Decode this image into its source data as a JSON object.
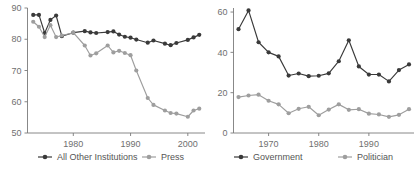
{
  "figure": {
    "background": "#ffffff",
    "panel_count": 2
  },
  "colors": {
    "dark_series": "#3a3a3a",
    "light_series": "#9e9e9e",
    "axis": "#7a7a7a",
    "tick_label": "#6f6f6f",
    "legend_label": "#555555"
  },
  "chart_data": [
    {
      "type": "line",
      "title": "",
      "xlabel": "",
      "ylabel": "",
      "xlim": [
        1972,
        2003
      ],
      "ylim": [
        50,
        90
      ],
      "ytick_values": [
        50,
        60,
        70,
        80,
        90
      ],
      "ytick_labels": [
        "50",
        "60",
        "70",
        "80",
        "90"
      ],
      "xtick_values": [
        1980,
        1990,
        2000
      ],
      "xtick_labels": [
        "1980",
        "1990",
        "2000"
      ],
      "grid": false,
      "legend_position": "below",
      "markers": "circle",
      "series": [
        {
          "name": "All Other Institutions",
          "color": "#3a3a3a",
          "x": [
            1973,
            1974,
            1975,
            1976,
            1977,
            1978,
            1980,
            1982,
            1983,
            1984,
            1986,
            1987,
            1988,
            1989,
            1990,
            1991,
            1993,
            1994,
            1996,
            1997,
            1998,
            2000,
            2001,
            2002
          ],
          "values": [
            87.8,
            87.8,
            82.0,
            86.2,
            87.6,
            81.0,
            82.1,
            82.6,
            82.2,
            82.0,
            82.3,
            82.5,
            81.5,
            80.8,
            80.5,
            79.9,
            78.9,
            79.6,
            78.6,
            78.1,
            78.8,
            79.8,
            80.6,
            81.4
          ]
        },
        {
          "name": "Press",
          "color": "#9e9e9e",
          "x": [
            1973,
            1974,
            1975,
            1976,
            1977,
            1978,
            1980,
            1982,
            1983,
            1984,
            1986,
            1987,
            1988,
            1989,
            1990,
            1991,
            1993,
            1994,
            1996,
            1997,
            1998,
            2000,
            2001,
            2002
          ],
          "values": [
            85.6,
            84.0,
            80.7,
            84.5,
            80.7,
            81.2,
            82.1,
            78.0,
            74.8,
            75.5,
            78.0,
            75.8,
            76.3,
            75.6,
            74.9,
            70.0,
            61.2,
            59.0,
            57.2,
            56.4,
            56.2,
            55.2,
            57.2,
            57.8
          ]
        }
      ]
    },
    {
      "type": "line",
      "title": "",
      "xlabel": "",
      "ylabel": "",
      "xlim": [
        1963,
        1999
      ],
      "ylim": [
        0,
        62
      ],
      "ytick_values": [
        0,
        20,
        40,
        60
      ],
      "ytick_labels": [
        "0",
        "20",
        "40",
        "60"
      ],
      "xtick_values": [
        1970,
        1980,
        1990
      ],
      "xtick_labels": [
        "1970",
        "1980",
        "1990"
      ],
      "grid": false,
      "legend_position": "below",
      "markers": "circle",
      "series": [
        {
          "name": "Government",
          "color": "#3a3a3a",
          "x": [
            1964,
            1966,
            1968,
            1970,
            1972,
            1974,
            1976,
            1978,
            1980,
            1982,
            1984,
            1986,
            1988,
            1990,
            1992,
            1994,
            1996,
            1998
          ],
          "values": [
            51.5,
            60.8,
            45.0,
            40.0,
            38.0,
            28.5,
            29.5,
            28.2,
            28.4,
            29.6,
            35.6,
            46.0,
            33.0,
            29.0,
            29.0,
            25.6,
            31.2,
            34.0
          ]
        },
        {
          "name": "Politician",
          "color": "#9e9e9e",
          "x": [
            1964,
            1966,
            1968,
            1970,
            1972,
            1974,
            1976,
            1978,
            1980,
            1982,
            1984,
            1986,
            1988,
            1990,
            1992,
            1994,
            1996,
            1998
          ],
          "values": [
            17.8,
            18.6,
            19.0,
            16.0,
            14.2,
            9.8,
            12.0,
            13.0,
            8.8,
            11.6,
            14.2,
            11.5,
            11.8,
            9.6,
            9.2,
            8.0,
            9.0,
            11.8
          ]
        }
      ]
    }
  ],
  "panels": [
    {
      "id": "left",
      "legend": [
        {
          "label": "All Other Institutions",
          "color": "#3a3a3a"
        },
        {
          "label": "Press",
          "color": "#9e9e9e"
        }
      ]
    },
    {
      "id": "right",
      "legend": [
        {
          "label": "Government",
          "color": "#3a3a3a"
        },
        {
          "label": "Politician",
          "color": "#9e9e9e"
        }
      ]
    }
  ]
}
